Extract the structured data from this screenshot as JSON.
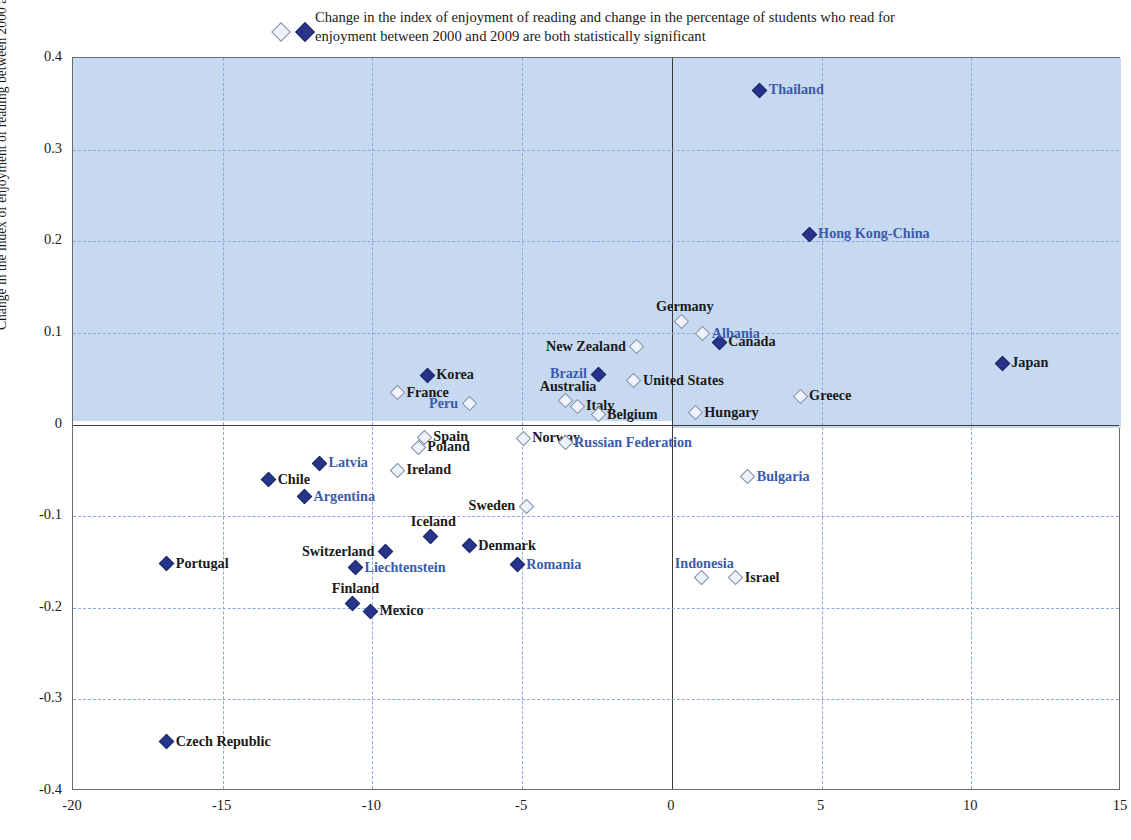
{
  "legend": {
    "marker_hollow": "hollow-diamond-icon",
    "marker_filled": "filled-diamond-icon",
    "text": "Change in the index of enjoyment of reading and change in the percentage of students who read for enjoyment between 2000 and 2009 are both statistically significant"
  },
  "colors": {
    "filled_marker": "#26358a",
    "hollow_marker_fill": "#eef3fb",
    "hollow_marker_stroke": "#7d8ea8",
    "quadrant_shade": "#c6d9f1",
    "gridline": "#8fa8d8",
    "blue_label": "#3b5bad",
    "black_label": "#1a1a1a",
    "axis": "#3a3a3a"
  },
  "chart_data": {
    "type": "scatter",
    "title": "",
    "xlabel": "",
    "ylabel": "Change in the index of enjoyment of reading between 2000 and 2009",
    "xlim": [
      -20,
      15
    ],
    "ylim": [
      -0.4,
      0.4
    ],
    "xticks": [
      -20,
      -15,
      -10,
      -5,
      0,
      5,
      10,
      15
    ],
    "yticks": [
      0.4,
      0.3,
      0.2,
      0.1,
      0,
      -0.1,
      -0.2,
      -0.3,
      -0.4
    ],
    "ytick_labels": [
      "0.4",
      "0.3",
      "0.2",
      "0.1",
      "0",
      "-0.1",
      "-0.2",
      "-0.3",
      "-0.4"
    ],
    "xtick_labels": [
      "-20",
      "-15",
      "-10",
      "-5",
      "0",
      "5",
      "10",
      "15"
    ],
    "grid": true,
    "legend_position": "top",
    "series": [
      {
        "name": "Both changes statistically significant",
        "marker": "filled",
        "points": [
          {
            "label": "Thailand",
            "x": 2.9,
            "y": 0.366,
            "significant": true,
            "label_color": "blue",
            "label_pos": "right"
          },
          {
            "label": "Hong Kong-China",
            "x": 4.55,
            "y": 0.209,
            "significant": true,
            "label_color": "blue",
            "label_pos": "right"
          },
          {
            "label": "Canada",
            "x": 1.55,
            "y": 0.091,
            "significant": true,
            "label_color": "black",
            "label_pos": "right"
          },
          {
            "label": "Japan",
            "x": 11.0,
            "y": 0.068,
            "significant": true,
            "label_color": "black",
            "label_pos": "right"
          },
          {
            "label": "Korea",
            "x": -8.2,
            "y": 0.055,
            "significant": true,
            "label_color": "black",
            "label_pos": "right"
          },
          {
            "label": "Brazil",
            "x": -2.5,
            "y": 0.056,
            "significant": true,
            "label_color": "blue",
            "label_pos": "left"
          },
          {
            "label": "Latvia",
            "x": -11.8,
            "y": -0.041,
            "significant": true,
            "label_color": "blue",
            "label_pos": "right"
          },
          {
            "label": "Chile",
            "x": -13.5,
            "y": -0.059,
            "significant": true,
            "label_color": "black",
            "label_pos": "right"
          },
          {
            "label": "Argentina",
            "x": -12.3,
            "y": -0.078,
            "significant": true,
            "label_color": "blue",
            "label_pos": "right"
          },
          {
            "label": "Iceland",
            "x": -8.1,
            "y": -0.121,
            "significant": true,
            "label_color": "black",
            "label_pos": "top"
          },
          {
            "label": "Switzerland",
            "x": -9.6,
            "y": -0.138,
            "significant": true,
            "label_color": "black",
            "label_pos": "left"
          },
          {
            "label": "Denmark",
            "x": -6.8,
            "y": -0.131,
            "significant": true,
            "label_color": "black",
            "label_pos": "right"
          },
          {
            "label": "Liechtenstein",
            "x": -10.6,
            "y": -0.155,
            "significant": true,
            "label_color": "blue",
            "label_pos": "right"
          },
          {
            "label": "Romania",
            "x": -5.2,
            "y": -0.152,
            "significant": true,
            "label_color": "blue",
            "label_pos": "right"
          },
          {
            "label": "Portugal",
            "x": -16.9,
            "y": -0.151,
            "significant": true,
            "label_color": "black",
            "label_pos": "right"
          },
          {
            "label": "Finland",
            "x": -10.7,
            "y": -0.194,
            "significant": true,
            "label_color": "black",
            "label_pos": "top"
          },
          {
            "label": "Mexico",
            "x": -10.1,
            "y": -0.203,
            "significant": true,
            "label_color": "black",
            "label_pos": "right"
          },
          {
            "label": "Czech Republic",
            "x": -16.9,
            "y": -0.345,
            "significant": true,
            "label_color": "black",
            "label_pos": "right"
          }
        ]
      },
      {
        "name": "Not both statistically significant",
        "marker": "hollow",
        "points": [
          {
            "label": "Germany",
            "x": 0.3,
            "y": 0.114,
            "significant": false,
            "label_color": "black",
            "label_pos": "top"
          },
          {
            "label": "Albania",
            "x": 1.0,
            "y": 0.1,
            "significant": false,
            "label_color": "blue",
            "label_pos": "right"
          },
          {
            "label": "New Zealand",
            "x": -1.2,
            "y": 0.086,
            "significant": false,
            "label_color": "black",
            "label_pos": "left"
          },
          {
            "label": "United States",
            "x": -1.3,
            "y": 0.049,
            "significant": false,
            "label_color": "black",
            "label_pos": "right"
          },
          {
            "label": "France",
            "x": -9.2,
            "y": 0.036,
            "significant": false,
            "label_color": "black",
            "label_pos": "right"
          },
          {
            "label": "Greece",
            "x": 4.25,
            "y": 0.032,
            "significant": false,
            "label_color": "black",
            "label_pos": "right"
          },
          {
            "label": "Australia",
            "x": -3.6,
            "y": 0.027,
            "significant": false,
            "label_color": "black",
            "label_pos": "top"
          },
          {
            "label": "Italy",
            "x": -3.2,
            "y": 0.021,
            "significant": false,
            "label_color": "black",
            "label_pos": "right"
          },
          {
            "label": "Peru",
            "x": -6.8,
            "y": 0.024,
            "significant": false,
            "label_color": "blue",
            "label_pos": "left"
          },
          {
            "label": "Hungary",
            "x": 0.75,
            "y": 0.014,
            "significant": false,
            "label_color": "black",
            "label_pos": "right"
          },
          {
            "label": "Belgium",
            "x": -2.5,
            "y": 0.012,
            "significant": false,
            "label_color": "black",
            "label_pos": "right"
          },
          {
            "label": "Spain",
            "x": -8.3,
            "y": -0.013,
            "significant": false,
            "label_color": "black",
            "label_pos": "right"
          },
          {
            "label": "Norway",
            "x": -5.0,
            "y": -0.014,
            "significant": false,
            "label_color": "black",
            "label_pos": "right"
          },
          {
            "label": "Russian Federation",
            "x": -3.6,
            "y": -0.019,
            "significant": false,
            "label_color": "blue",
            "label_pos": "right"
          },
          {
            "label": "Poland",
            "x": -8.5,
            "y": -0.024,
            "significant": false,
            "label_color": "black",
            "label_pos": "right"
          },
          {
            "label": "Ireland",
            "x": -9.2,
            "y": -0.049,
            "significant": false,
            "label_color": "black",
            "label_pos": "right"
          },
          {
            "label": "Bulgaria",
            "x": 2.5,
            "y": -0.056,
            "significant": false,
            "label_color": "blue",
            "label_pos": "right"
          },
          {
            "label": "Sweden",
            "x": -4.9,
            "y": -0.088,
            "significant": false,
            "label_color": "black",
            "label_pos": "left"
          },
          {
            "label": "Indonesia",
            "x": 0.95,
            "y": -0.166,
            "significant": false,
            "label_color": "blue",
            "label_pos": "top"
          },
          {
            "label": "Israel",
            "x": 2.1,
            "y": -0.166,
            "significant": false,
            "label_color": "black",
            "label_pos": "right"
          }
        ]
      }
    ]
  }
}
